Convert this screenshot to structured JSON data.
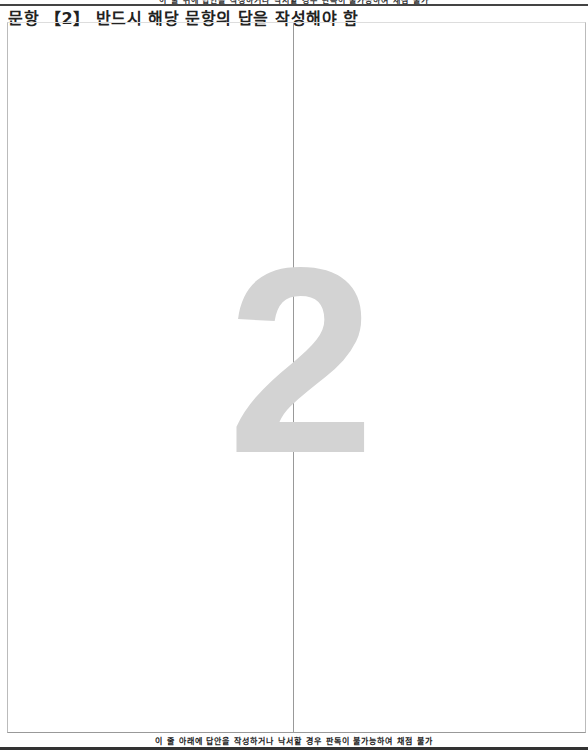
{
  "header": {
    "top_notice": "이 줄 위에 답안을 작성하거나 낙서할 경우 판독이 불가능하여 채점 불가",
    "title": "문항 【2】 반드시 해당 문항의 답을 작성해야 함"
  },
  "answer_sheet": {
    "question_number_watermark": "2",
    "columns": [
      "left",
      "right"
    ]
  },
  "footer": {
    "bottom_notice": "이 줄 아래에 답안을 작성하거나 낙서할 경우 판독이 불가능하여 채점 불가"
  },
  "colors": {
    "watermark": "#d3d3d3",
    "rule": "#444444",
    "border": "#bbbbbb"
  }
}
